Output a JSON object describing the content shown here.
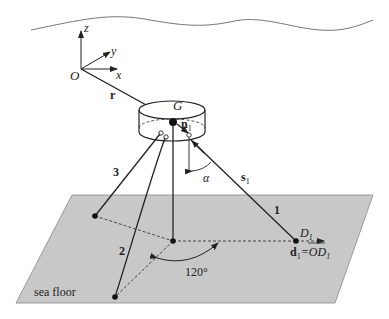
{
  "diagram": {
    "axes": {
      "origin": "O",
      "x": "x",
      "y": "y",
      "z": "z"
    },
    "vectors": {
      "r": "r",
      "n": "n",
      "n_sub": "1",
      "s": "s",
      "s_sub": "1"
    },
    "body_label": "G",
    "angle_label": "α",
    "angle_120": "120°",
    "cables": {
      "c1": "1",
      "c2": "2",
      "c3": "3"
    },
    "anchor_label": "D",
    "anchor_sub": "1",
    "d_eq_bold": "d",
    "d_eq_sub": "1",
    "d_eq_rest": "=OD",
    "d_eq_rest_sub": "1",
    "floor_label": "sea floor"
  },
  "colors": {
    "floor_fill": "#c8c8c8",
    "floor_stroke": "#9a9a9a",
    "line": "#222222",
    "surface": "#777777"
  }
}
